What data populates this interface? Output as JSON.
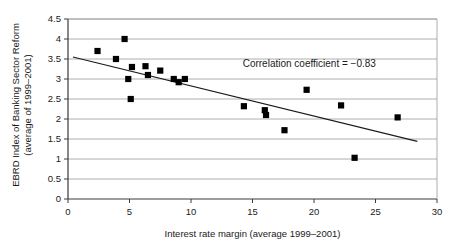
{
  "chart_data": {
    "type": "scatter",
    "title": "",
    "xlabel": "Interest rate margin (average 1999–2001)",
    "ylabel_line1": "EBRD Index of Banking Sector Reform",
    "ylabel_line2": "(average of 1999–2001)",
    "xlim": [
      0,
      30
    ],
    "ylim": [
      0,
      4.5
    ],
    "xticks": [
      0,
      5,
      10,
      15,
      20,
      25,
      30
    ],
    "yticks": [
      0,
      0.5,
      1,
      1.5,
      2,
      2.5,
      3,
      3.5,
      4,
      4.5
    ],
    "xtick_labels": [
      "0",
      "5",
      "10",
      "15",
      "20",
      "25",
      "30"
    ],
    "ytick_labels": [
      "0",
      "0.5",
      "1",
      "1.5",
      "2",
      "2.5",
      "3",
      "3.5",
      "4",
      "4.5"
    ],
    "grid": "horizontal",
    "legend": "none",
    "marker": "filled-square",
    "marker_color": "#000000",
    "annotation": {
      "text": "Correlation coefficient = −0.83",
      "x": 14.2,
      "y": 3.3
    },
    "correlation_coefficient": -0.83,
    "points": [
      {
        "x": 2.4,
        "y": 3.7
      },
      {
        "x": 3.9,
        "y": 3.5
      },
      {
        "x": 4.6,
        "y": 4.0
      },
      {
        "x": 4.9,
        "y": 3.0
      },
      {
        "x": 5.1,
        "y": 2.5
      },
      {
        "x": 5.2,
        "y": 3.3
      },
      {
        "x": 6.3,
        "y": 3.32
      },
      {
        "x": 6.5,
        "y": 3.1
      },
      {
        "x": 7.5,
        "y": 3.21
      },
      {
        "x": 8.6,
        "y": 3.0
      },
      {
        "x": 9.0,
        "y": 2.92
      },
      {
        "x": 9.5,
        "y": 3.0
      },
      {
        "x": 14.3,
        "y": 2.32
      },
      {
        "x": 16.0,
        "y": 2.22
      },
      {
        "x": 16.1,
        "y": 2.1
      },
      {
        "x": 17.6,
        "y": 1.72
      },
      {
        "x": 19.4,
        "y": 2.73
      },
      {
        "x": 22.2,
        "y": 2.34
      },
      {
        "x": 23.3,
        "y": 1.03
      },
      {
        "x": 26.8,
        "y": 2.04
      }
    ],
    "trendline": {
      "type": "linear",
      "x_start": 0.4,
      "y_start": 3.55,
      "x_end": 28.4,
      "y_end": 1.44
    }
  }
}
